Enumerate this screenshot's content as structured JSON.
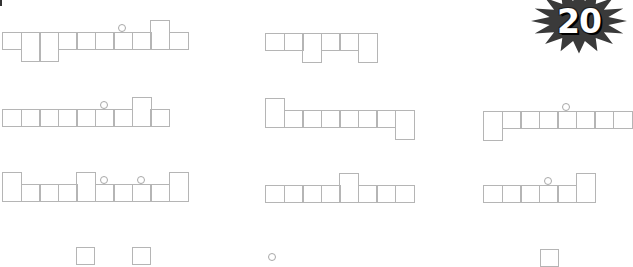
{
  "page": {
    "badge": {
      "number": "20",
      "fill": "#3a3a3a",
      "text_color": "#ffffff"
    },
    "line_color": "#b5b5b5",
    "cell_size": {
      "w": 18.5,
      "h": 18
    }
  },
  "puzzles": [
    {
      "id": "row1-left",
      "origin": [
        2,
        32
      ],
      "cells": [
        {
          "col": 0,
          "type": "normal"
        },
        {
          "col": 1,
          "type": "down"
        },
        {
          "col": 2,
          "type": "down"
        },
        {
          "col": 3,
          "type": "normal"
        },
        {
          "col": 4,
          "type": "normal"
        },
        {
          "col": 5,
          "type": "normal"
        },
        {
          "col": 6,
          "type": "normal"
        },
        {
          "col": 7,
          "type": "normal"
        },
        {
          "col": 8,
          "type": "up"
        },
        {
          "col": 9,
          "type": "normal"
        }
      ],
      "dots": [
        6
      ]
    },
    {
      "id": "row1-middle",
      "origin": [
        265,
        33
      ],
      "cells": [
        {
          "col": 0,
          "type": "normal"
        },
        {
          "col": 1,
          "type": "normal"
        },
        {
          "col": 2,
          "type": "down"
        },
        {
          "col": 3,
          "type": "normal"
        },
        {
          "col": 4,
          "type": "normal"
        },
        {
          "col": 5,
          "type": "down"
        }
      ],
      "dots": []
    },
    {
      "id": "row2-left",
      "origin": [
        2,
        109
      ],
      "cells": [
        {
          "col": 0,
          "type": "normal"
        },
        {
          "col": 1,
          "type": "normal"
        },
        {
          "col": 2,
          "type": "normal"
        },
        {
          "col": 3,
          "type": "normal"
        },
        {
          "col": 4,
          "type": "normal"
        },
        {
          "col": 5,
          "type": "normal"
        },
        {
          "col": 6,
          "type": "normal"
        },
        {
          "col": 7,
          "type": "up"
        },
        {
          "col": 8,
          "type": "normal"
        }
      ],
      "dots": [
        5
      ]
    },
    {
      "id": "row2-middle",
      "origin": [
        265,
        110
      ],
      "cells": [
        {
          "col": 0,
          "type": "up"
        },
        {
          "col": 1,
          "type": "normal"
        },
        {
          "col": 2,
          "type": "normal"
        },
        {
          "col": 3,
          "type": "normal"
        },
        {
          "col": 4,
          "type": "normal"
        },
        {
          "col": 5,
          "type": "normal"
        },
        {
          "col": 6,
          "type": "normal"
        },
        {
          "col": 7,
          "type": "down"
        }
      ],
      "dots": []
    },
    {
      "id": "row2-right",
      "origin": [
        483,
        111
      ],
      "cells": [
        {
          "col": 0,
          "type": "down"
        },
        {
          "col": 1,
          "type": "normal"
        },
        {
          "col": 2,
          "type": "normal"
        },
        {
          "col": 3,
          "type": "normal"
        },
        {
          "col": 4,
          "type": "normal"
        },
        {
          "col": 5,
          "type": "normal"
        },
        {
          "col": 6,
          "type": "normal"
        },
        {
          "col": 7,
          "type": "normal"
        }
      ],
      "dots": [
        4
      ]
    },
    {
      "id": "row3-left",
      "origin": [
        2,
        184
      ],
      "cells": [
        {
          "col": 0,
          "type": "up"
        },
        {
          "col": 1,
          "type": "normal"
        },
        {
          "col": 2,
          "type": "normal"
        },
        {
          "col": 3,
          "type": "normal"
        },
        {
          "col": 4,
          "type": "up"
        },
        {
          "col": 5,
          "type": "normal"
        },
        {
          "col": 6,
          "type": "normal"
        },
        {
          "col": 7,
          "type": "normal"
        },
        {
          "col": 8,
          "type": "normal"
        },
        {
          "col": 9,
          "type": "up"
        }
      ],
      "dots": [
        5,
        7
      ]
    },
    {
      "id": "row3-middle",
      "origin": [
        265,
        185
      ],
      "cells": [
        {
          "col": 0,
          "type": "normal"
        },
        {
          "col": 1,
          "type": "normal"
        },
        {
          "col": 2,
          "type": "normal"
        },
        {
          "col": 3,
          "type": "normal"
        },
        {
          "col": 4,
          "type": "up"
        },
        {
          "col": 5,
          "type": "normal"
        },
        {
          "col": 6,
          "type": "normal"
        },
        {
          "col": 7,
          "type": "normal"
        }
      ],
      "dots": []
    },
    {
      "id": "row3-right",
      "origin": [
        483,
        185
      ],
      "cells": [
        {
          "col": 0,
          "type": "normal"
        },
        {
          "col": 1,
          "type": "normal"
        },
        {
          "col": 2,
          "type": "normal"
        },
        {
          "col": 3,
          "type": "normal"
        },
        {
          "col": 4,
          "type": "normal"
        },
        {
          "col": 5,
          "type": "up"
        }
      ],
      "dots": [
        3
      ]
    }
  ],
  "partial_bottom": {
    "cells": [
      [
        76,
        247
      ],
      [
        132,
        247
      ],
      [
        540,
        249
      ]
    ],
    "dots": [
      [
        272,
        256
      ]
    ]
  }
}
